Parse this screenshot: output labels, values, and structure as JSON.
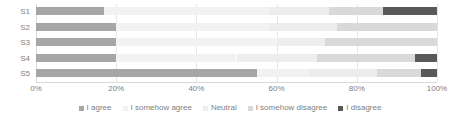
{
  "chart_data": {
    "type": "bar",
    "orientation": "horizontal",
    "stacked": true,
    "normalized_percent": true,
    "title": "",
    "xlabel": "",
    "ylabel": "",
    "xlim": [
      0,
      100
    ],
    "grid": true,
    "legend_position": "bottom",
    "categories": [
      "S1",
      "S2",
      "S3",
      "S4",
      "S5"
    ],
    "xticks": [
      "0%",
      "20%",
      "40%",
      "60%",
      "80%",
      "100%"
    ],
    "xtick_values": [
      0,
      20,
      40,
      60,
      80,
      100
    ],
    "series": [
      {
        "name": "I agree",
        "color": "#a6a6a6",
        "values": [
          17.0,
          20.0,
          20.0,
          20.0,
          55.0
        ]
      },
      {
        "name": "I somehow agree",
        "color": "#f2f2f2",
        "values": [
          41.0,
          38.0,
          40.0,
          30.0,
          13.0
        ]
      },
      {
        "name": "Neutral",
        "color": "#ededed",
        "values": [
          15.0,
          17.0,
          12.0,
          20.0,
          17.0
        ]
      },
      {
        "name": "I somehow disagree",
        "color": "#d9d9d9",
        "values": [
          13.5,
          25.0,
          28.0,
          24.5,
          11.0
        ]
      },
      {
        "name": "I disagree",
        "color": "#595959",
        "values": [
          13.5,
          0.0,
          0.0,
          5.5,
          4.0
        ]
      }
    ]
  },
  "legend": {
    "items": [
      {
        "label": "I agree",
        "color": "#a6a6a6"
      },
      {
        "label": "I somehow agree",
        "color": "#f2f2f2"
      },
      {
        "label": "Neutral",
        "color": "#ededed"
      },
      {
        "label": "I somehow disagree",
        "color": "#d9d9d9"
      },
      {
        "label": "I disagree",
        "color": "#595959"
      }
    ]
  },
  "style": {
    "gridline_color": "#e6e6e6",
    "axis_color": "#d9d9d9",
    "text_color": "#808080",
    "background": "#ffffff"
  }
}
